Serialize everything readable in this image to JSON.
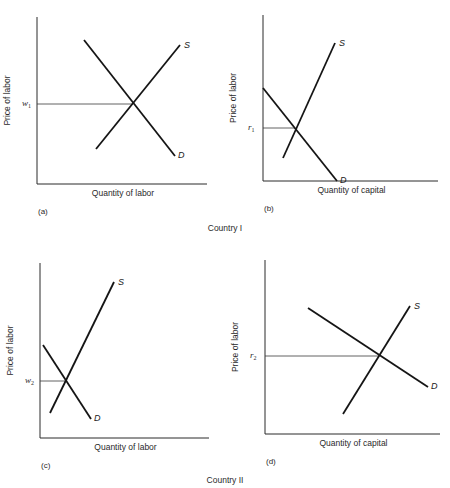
{
  "chart_data": [
    {
      "type": "line",
      "panel": "(a)",
      "group": "Country I",
      "xlabel": "Quantity of labor",
      "ylabel": "Price of labor",
      "equilibrium_label": "w",
      "equilibrium_sub": "1",
      "series": [
        {
          "name": "S",
          "points": [
            [
              96,
              149
            ],
            [
              180,
              45
            ]
          ]
        },
        {
          "name": "D",
          "points": [
            [
              84,
              40
            ],
            [
              175,
              156
            ]
          ]
        }
      ],
      "equilibrium": [
        133,
        104
      ],
      "axes": {
        "x0": 37,
        "y_top": 17,
        "y0": 184,
        "x_right": 207
      }
    },
    {
      "type": "line",
      "panel": "(b)",
      "group": "Country I",
      "xlabel": "Quantity of capital",
      "ylabel": "Price of labor",
      "equilibrium_label": "r",
      "equilibrium_sub": "1",
      "series": [
        {
          "name": "S",
          "points": [
            [
              283,
              158
            ],
            [
              335,
              43
            ]
          ]
        },
        {
          "name": "D",
          "points": [
            [
              263,
              88
            ],
            [
              337,
              181
            ]
          ]
        }
      ],
      "equilibrium": [
        295,
        128
      ],
      "axes": {
        "x0": 263,
        "y_top": 15,
        "y0": 181,
        "x_right": 438
      }
    },
    {
      "type": "line",
      "panel": "(c)",
      "group": "Country II",
      "xlabel": "Quantity of labor",
      "ylabel": "Price of labor",
      "equilibrium_label": "w",
      "equilibrium_sub": "2",
      "series": [
        {
          "name": "S",
          "points": [
            [
              50,
              413
            ],
            [
              114,
              282
            ]
          ]
        },
        {
          "name": "D",
          "points": [
            [
              43,
              345
            ],
            [
              91,
              419
            ]
          ]
        }
      ],
      "equilibrium": [
        66,
        381
      ],
      "axes": {
        "x0": 40,
        "y_top": 263,
        "y0": 438,
        "x_right": 209
      }
    },
    {
      "type": "line",
      "panel": "(d)",
      "group": "Country II",
      "xlabel": "Quantity of capital",
      "ylabel": "Price of labor",
      "equilibrium_label": "r",
      "equilibrium_sub": "2",
      "series": [
        {
          "name": "S",
          "points": [
            [
              343,
              414
            ],
            [
              410,
              306
            ]
          ]
        },
        {
          "name": "D",
          "points": [
            [
              308,
              308
            ],
            [
              428,
              387
            ]
          ]
        }
      ],
      "equilibrium": [
        379,
        356
      ],
      "axes": {
        "x0": 265,
        "y_top": 260,
        "y0": 434,
        "x_right": 440
      }
    }
  ],
  "groups": {
    "country_1": "Country I",
    "country_2": "Country II"
  },
  "labels": {
    "supply": "S",
    "demand": "D"
  }
}
